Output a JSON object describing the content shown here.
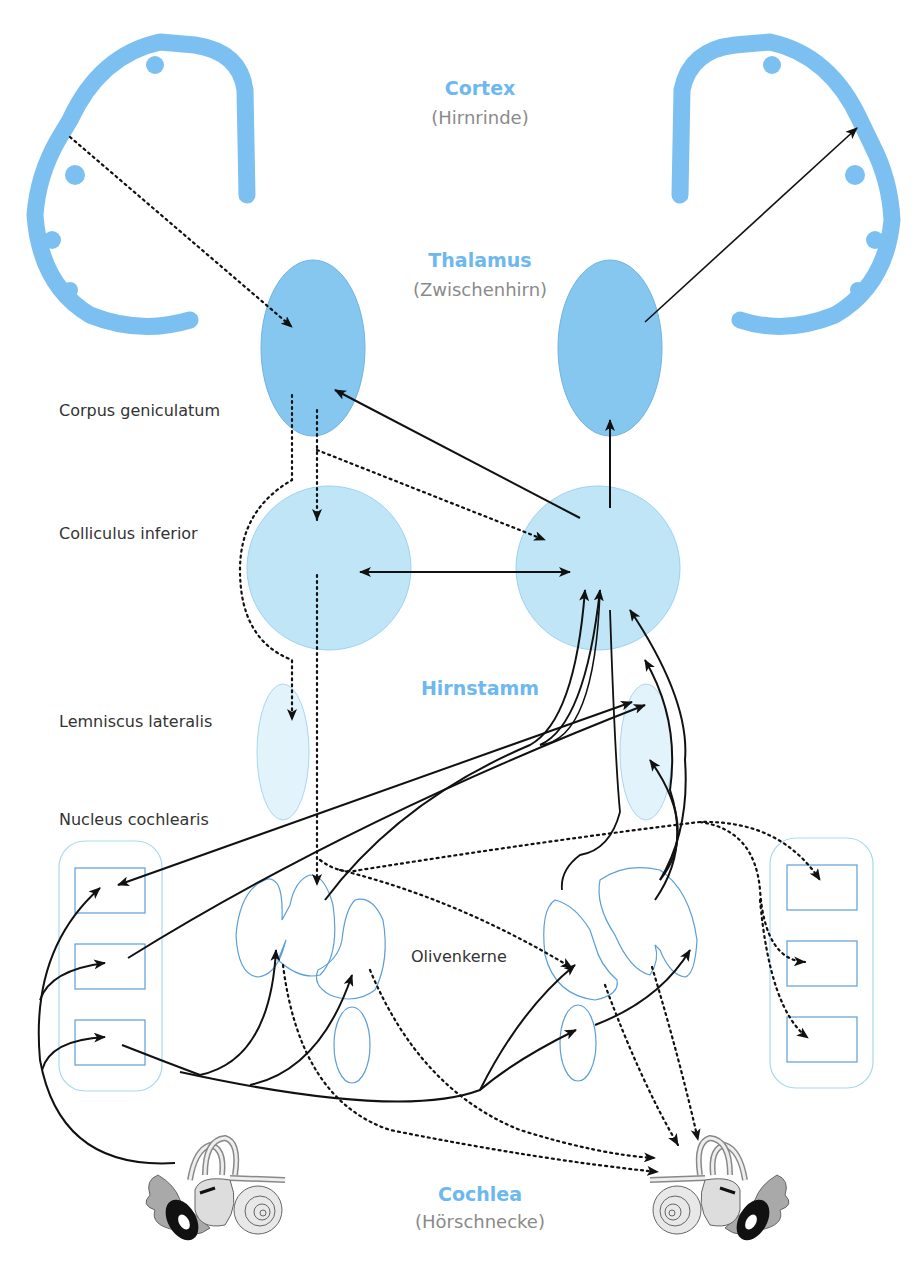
{
  "diagram": {
    "levels": {
      "cortex": {
        "name": "Cortex",
        "subtitle": "(Hirnrinde)"
      },
      "thalamus": {
        "name": "Thalamus",
        "subtitle": "(Zwischenhirn)"
      },
      "hirnstamm": {
        "name": "Hirnstamm"
      },
      "cochlea": {
        "name": "Cochlea",
        "subtitle": "(Hörschnecke)"
      }
    },
    "side_labels": {
      "corpus_geniculatum": "Corpus geniculatum",
      "colliculus_inferior": "Colliculus inferior",
      "lemniscus_lateralis": "Lemniscus lateralis",
      "nucleus_cochlearis": "Nucleus cochlearis",
      "olivenkerne": "Olivenkerne"
    },
    "legend": {
      "solid_line": "ascending pathway (afferent)",
      "dotted_line": "descending pathway (efferent)"
    },
    "colors": {
      "cortex": "#7cc0f2",
      "thalamus_fill": "#86c7f0",
      "colliculus_fill": "#bfe5f7",
      "lemniscus_fill": "#e3f3fb",
      "outline": "#5b9fd8",
      "outline_light": "#a9d7f1",
      "title_text": "#6cb8ef",
      "subtitle_text": "#8a8a8a",
      "label_text": "#333333",
      "arrow": "#111111"
    },
    "icons": {
      "cochlea_left": "inner-ear-icon",
      "cochlea_right": "inner-ear-icon"
    }
  }
}
